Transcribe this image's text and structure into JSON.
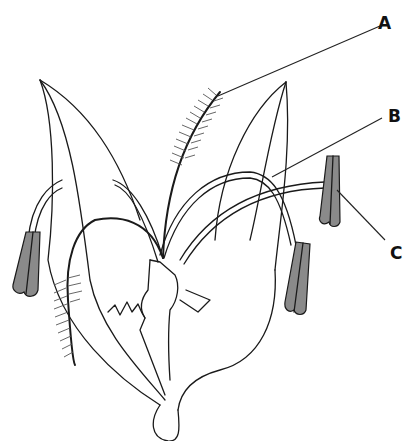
{
  "figure": {
    "colors": {
      "outline": "#1a1a1a",
      "anther_fill": "#8a8a8a",
      "background": "#ffffff"
    },
    "labels": [
      {
        "id": "A",
        "text": "A",
        "x": 374,
        "y": 20
      },
      {
        "id": "B",
        "text": "B",
        "x": 374,
        "y": 110
      },
      {
        "id": "C",
        "text": "C",
        "x": 374,
        "y": 248
      }
    ]
  }
}
